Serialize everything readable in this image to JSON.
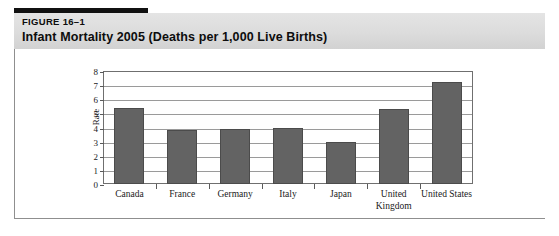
{
  "header": {
    "figure_number": "FIGURE 16–1",
    "title": "Infant Mortality 2005 (Deaths per 1,000 Live Births)",
    "accent_color": "#111111",
    "banner_color": "#dcdcdc"
  },
  "chart_data": {
    "type": "bar",
    "title": "Infant Mortality 2005 (Deaths per 1,000 Live Births)",
    "xlabel": "",
    "ylabel": "Rate",
    "categories": [
      "Canada",
      "France",
      "Germany",
      "Italy",
      "Japan",
      "United Kingdom",
      "United States"
    ],
    "values": [
      5.4,
      3.8,
      3.9,
      4.0,
      3.0,
      5.3,
      7.2
    ],
    "ylim": [
      0,
      8
    ],
    "yticks": [
      0,
      1,
      2,
      3,
      4,
      5,
      6,
      7,
      8
    ],
    "ytick_labels": [
      "0",
      "1",
      "2",
      "3",
      "4",
      "5",
      "6",
      "7",
      "8"
    ],
    "grid": true,
    "legend": false,
    "bar_color": "#636363",
    "bar_edge_color": "#4b4b4b",
    "gridline_color": "#9a9a9a",
    "axis_color": "#6f6f6f"
  }
}
